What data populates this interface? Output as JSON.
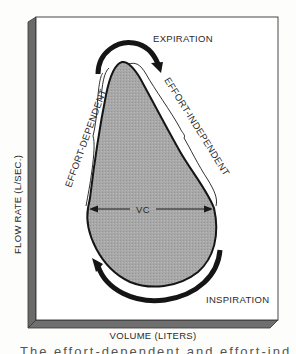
{
  "diagram": {
    "labels": {
      "expiration": "EXPIRATION",
      "inspiration": "INSPIRATION",
      "effort_dependent": "EFFORT-DEPENDENT",
      "effort_independent": "EFFORT-INDEPENDENT",
      "vc": "VC"
    },
    "axes": {
      "y_label": "FLOW RATE (L/SEC.)",
      "x_label": "VOLUME (LITERS)"
    },
    "colors": {
      "loop_fill": "#a9a9a9",
      "outline": "#1a1a1a",
      "panel": "#ffffff",
      "bevel": "#6e6e6e"
    },
    "caption_cutoff": "The effort-dependent and effort-independent"
  }
}
